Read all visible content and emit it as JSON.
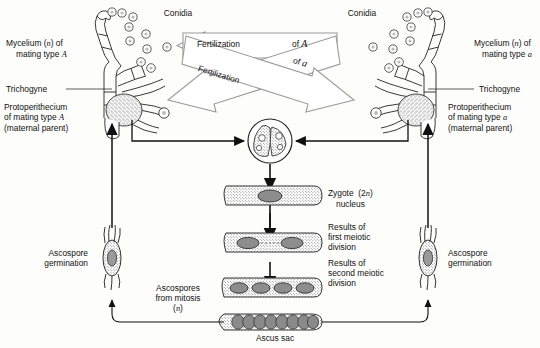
{
  "diagram": {
    "colors": {
      "ink": "#111111",
      "background": "#fdfdfb",
      "stipple": "#555555",
      "nucleus_fill": "#8d8d8d",
      "arrow_outline": "#888888",
      "arrow_fill": "#ffffff"
    },
    "labels": {
      "conidia_left": "Conidia",
      "conidia_right": "Conidia",
      "mycelium_left_line1": "Mycelium (",
      "mycelium_left_n": "n",
      "mycelium_left_line1b": ") of",
      "mycelium_left_line2a": "mating type ",
      "mycelium_left_type": "A",
      "mycelium_right_line1": "Mycelium (",
      "mycelium_right_n": "n",
      "mycelium_right_line1b": ") of",
      "mycelium_right_line2a": "mating type ",
      "mycelium_right_type": "a",
      "trichogyne_left": "Trichogyne",
      "trichogyne_right": "Trichogyne",
      "protoperithecium_left_l1": "Protoperithecium",
      "protoperithecium_left_l2a": "of mating type ",
      "protoperithecium_left_type": "A",
      "protoperithecium_left_l3": "(maternal parent)",
      "protoperithecium_right_l1": "Protoperithecium",
      "protoperithecium_right_l2a": "of mating type ",
      "protoperithecium_right_type": "a",
      "protoperithecium_right_l3": "(maternal parent)",
      "fertilization_box": "Fertilization",
      "fertilization_box_of": "of ",
      "fertilization_box_type": "A",
      "fertilization_diag": "Fertilization",
      "fertilization_diag_of": "of ",
      "fertilization_diag_type": "a",
      "zygote_l1a": "Zygote  (2",
      "zygote_l1n": "n",
      "zygote_l1b": ")",
      "zygote_l2": "nucleus",
      "meiosis1_l1": "Results of",
      "meiosis1_l2": "first meiotic",
      "meiosis1_l3": "division",
      "meiosis2_l1": "Results of",
      "meiosis2_l2": "second meiotic",
      "meiosis2_l3": "division",
      "ascus_sac": "Ascus sac",
      "ascospores_l1": "Ascospores",
      "ascospores_l2": "from mitosis",
      "ascospores_l3n": "n",
      "ascospore_germ_left_l1": "Ascospore",
      "ascospore_germ_left_l2": "germination",
      "ascospore_germ_right_l1": "Ascospore",
      "ascospore_germ_right_l2": "germination"
    },
    "stages": {
      "zygote_nuclei": 1,
      "first_meiosis_nuclei": 2,
      "second_meiosis_nuclei": 4,
      "ascus_sac_ascospores": 8,
      "conidia_count_left": 9,
      "conidia_count_right": 9
    }
  }
}
